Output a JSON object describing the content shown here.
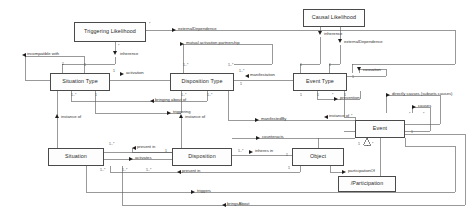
{
  "diagram": {
    "line_color": "#555555",
    "box_border_color": "#4a4a4a",
    "box_fill_color": "#fdfdfd",
    "classes": [
      {
        "id": "triggering-likelihood",
        "name": "Triggering Likelihood",
        "x": 74,
        "y": 22,
        "w": 72,
        "h": 20
      },
      {
        "id": "causal-likelihood",
        "name": "Causal Likelihood",
        "x": 303,
        "y": 9,
        "w": 62,
        "h": 18
      },
      {
        "id": "situation-type",
        "name": "Situation Type",
        "x": 50,
        "y": 73,
        "w": 60,
        "h": 18
      },
      {
        "id": "disposition-type",
        "name": "Disposition Type",
        "x": 170,
        "y": 73,
        "w": 64,
        "h": 18
      },
      {
        "id": "event-type",
        "name": "Event Type",
        "x": 293,
        "y": 73,
        "w": 54,
        "h": 18
      },
      {
        "id": "event",
        "name": "Event",
        "x": 355,
        "y": 120,
        "w": 50,
        "h": 18
      },
      {
        "id": "situation",
        "name": "Situation",
        "x": 48,
        "y": 148,
        "w": 56,
        "h": 18
      },
      {
        "id": "disposition",
        "name": "Disposition",
        "x": 172,
        "y": 148,
        "w": 60,
        "h": 18
      },
      {
        "id": "object",
        "name": "Object",
        "x": 292,
        "y": 148,
        "w": 52,
        "h": 18
      },
      {
        "id": "participation",
        "name": "/Participation",
        "x": 338,
        "y": 176,
        "w": 58,
        "h": 16
      }
    ],
    "edge_labels": [
      {
        "id": "incompatible-with",
        "text": "incompatible with",
        "x": 27,
        "y": 55,
        "dir": "left",
        "ax": 22,
        "ay": 55
      },
      {
        "id": "inherence-top",
        "text": "inherence",
        "x": 122,
        "y": 55,
        "dir": "down",
        "ax": 115,
        "ay": 53
      },
      {
        "id": "external-dependence-top",
        "text": "externalDependence",
        "x": 178,
        "y": 30,
        "dir": "right",
        "ax": 172,
        "ay": 30
      },
      {
        "id": "mutual-activation-partnership",
        "text": "mutual activation partnership",
        "x": 186,
        "y": 44,
        "dir": "right",
        "ax": 180,
        "ay": 44
      },
      {
        "id": "inherence-right",
        "text": "inherence",
        "x": 291,
        "y": 35,
        "dir": "down",
        "ax": 285,
        "ay": 33
      },
      {
        "id": "external-dependence-right",
        "text": "externalDependence",
        "x": 334,
        "y": 43,
        "dir": "down",
        "ax": 328,
        "ay": 41
      },
      {
        "id": "activation",
        "text": "activation",
        "x": 126,
        "y": 74,
        "dir": "right",
        "ax": 120,
        "ay": 74
      },
      {
        "id": "manifestation",
        "text": "manifestation",
        "x": 250,
        "y": 76,
        "dir": "left",
        "ax": 245,
        "ay": 76
      },
      {
        "id": "causation",
        "text": "causation",
        "x": 365,
        "y": 71,
        "dir": "down",
        "ax": 359,
        "ay": 69
      },
      {
        "id": "bringing-about-of",
        "text": "bringing about of",
        "x": 155,
        "y": 101,
        "dir": "left",
        "ax": 150,
        "ay": 101
      },
      {
        "id": "triggering",
        "text": "triggering",
        "x": 173,
        "y": 113,
        "dir": "right",
        "ax": 167,
        "ay": 113
      },
      {
        "id": "prevention",
        "text": "prevention",
        "x": 340,
        "y": 99,
        "dir": "right",
        "ax": 334,
        "ay": 99
      },
      {
        "id": "directly-causes",
        "text": "directly causes (subsets causes)",
        "x": 392,
        "y": 95,
        "dir": "right",
        "ax": 386,
        "ay": 95
      },
      {
        "id": "causes",
        "text": "causes",
        "x": 418,
        "y": 107,
        "dir": "right",
        "ax": 412,
        "ay": 107
      },
      {
        "id": "instance-of-situation",
        "text": "instance of",
        "x": 63,
        "y": 118,
        "dir": "up",
        "ax": 57,
        "ay": 116
      },
      {
        "id": "instance-of-disposition",
        "text": "instance of",
        "x": 187,
        "y": 118,
        "dir": "up",
        "ax": 181,
        "ay": 116
      },
      {
        "id": "manifested-by",
        "text": "manifestedBy",
        "x": 261,
        "y": 120,
        "dir": "right",
        "ax": 255,
        "ay": 120
      },
      {
        "id": "instance-of-event",
        "text": "instance of",
        "x": 329,
        "y": 117,
        "dir": "left",
        "ax": 324,
        "ay": 117
      },
      {
        "id": "counteracts",
        "text": "counteracts",
        "x": 262,
        "y": 138,
        "dir": "right",
        "ax": 256,
        "ay": 138
      },
      {
        "id": "present-in-top",
        "text": "present in",
        "x": 137,
        "y": 148,
        "dir": "left",
        "ax": 132,
        "ay": 148
      },
      {
        "id": "activates",
        "text": "activates",
        "x": 135,
        "y": 159,
        "dir": "right",
        "ax": 129,
        "ay": 159
      },
      {
        "id": "inheres-in",
        "text": "inheres in",
        "x": 255,
        "y": 152,
        "dir": "right",
        "ax": 249,
        "ay": 152
      },
      {
        "id": "present-in-bottom",
        "text": "present in",
        "x": 182,
        "y": 172,
        "dir": "left",
        "ax": 177,
        "ay": 172
      },
      {
        "id": "participation-of",
        "text": "participationOf",
        "x": 348,
        "y": 172,
        "dir": "right",
        "ax": 342,
        "ay": 172
      },
      {
        "id": "triggers",
        "text": "triggers",
        "x": 197,
        "y": 192,
        "dir": "right",
        "ax": 191,
        "ay": 192
      },
      {
        "id": "brings-about",
        "text": "bringsAbout",
        "x": 227,
        "y": 205,
        "dir": "left",
        "ax": 222,
        "ay": 205
      }
    ],
    "multiplicities": [
      {
        "id": "m1",
        "text": "*",
        "x": 149,
        "y": 23
      },
      {
        "id": "m2",
        "text": "*",
        "x": 118,
        "y": 45
      },
      {
        "id": "m3",
        "text": "1",
        "x": 62,
        "y": 63
      },
      {
        "id": "m4",
        "text": "1",
        "x": 84,
        "y": 64
      },
      {
        "id": "m5",
        "text": "1",
        "x": 113,
        "y": 70
      },
      {
        "id": "m6",
        "text": "1..*",
        "x": 71,
        "y": 94
      },
      {
        "id": "m7",
        "text": "1",
        "x": 95,
        "y": 94
      },
      {
        "id": "m8",
        "text": "1..*",
        "x": 183,
        "y": 64
      },
      {
        "id": "m9",
        "text": "1..*",
        "x": 228,
        "y": 64
      },
      {
        "id": "m10",
        "text": "1..*",
        "x": 239,
        "y": 70
      },
      {
        "id": "m11",
        "text": "1",
        "x": 240,
        "y": 83
      },
      {
        "id": "m12",
        "text": "1..*",
        "x": 181,
        "y": 94
      },
      {
        "id": "m13",
        "text": "1..*",
        "x": 207,
        "y": 94
      },
      {
        "id": "m14",
        "text": "1",
        "x": 300,
        "y": 64
      },
      {
        "id": "m15",
        "text": "1",
        "x": 329,
        "y": 64
      },
      {
        "id": "m16",
        "text": "1",
        "x": 352,
        "y": 76
      },
      {
        "id": "m17",
        "text": "1",
        "x": 300,
        "y": 94
      },
      {
        "id": "m18",
        "text": "1",
        "x": 317,
        "y": 94
      },
      {
        "id": "m19",
        "text": "*",
        "x": 332,
        "y": 94
      },
      {
        "id": "m20",
        "text": "1",
        "x": 344,
        "y": 94
      },
      {
        "id": "m21",
        "text": "*",
        "x": 409,
        "y": 113
      },
      {
        "id": "m22",
        "text": "*",
        "x": 423,
        "y": 113
      },
      {
        "id": "m23",
        "text": "*",
        "x": 351,
        "y": 115
      },
      {
        "id": "m24",
        "text": "1",
        "x": 411,
        "y": 131
      },
      {
        "id": "m25",
        "text": "1",
        "x": 358,
        "y": 143
      },
      {
        "id": "m26",
        "text": "*",
        "x": 372,
        "y": 143
      },
      {
        "id": "m27",
        "text": "1..*",
        "x": 109,
        "y": 143
      },
      {
        "id": "m28",
        "text": "1",
        "x": 165,
        "y": 150
      },
      {
        "id": "m29",
        "text": "1..*",
        "x": 238,
        "y": 150
      },
      {
        "id": "m30",
        "text": "1",
        "x": 286,
        "y": 154
      },
      {
        "id": "m31",
        "text": "1..*",
        "x": 100,
        "y": 169
      },
      {
        "id": "m32",
        "text": "1..*",
        "x": 122,
        "y": 169
      },
      {
        "id": "m33",
        "text": "1",
        "x": 288,
        "y": 167
      },
      {
        "id": "m34",
        "text": "1..*",
        "x": 146,
        "y": 169
      }
    ]
  }
}
